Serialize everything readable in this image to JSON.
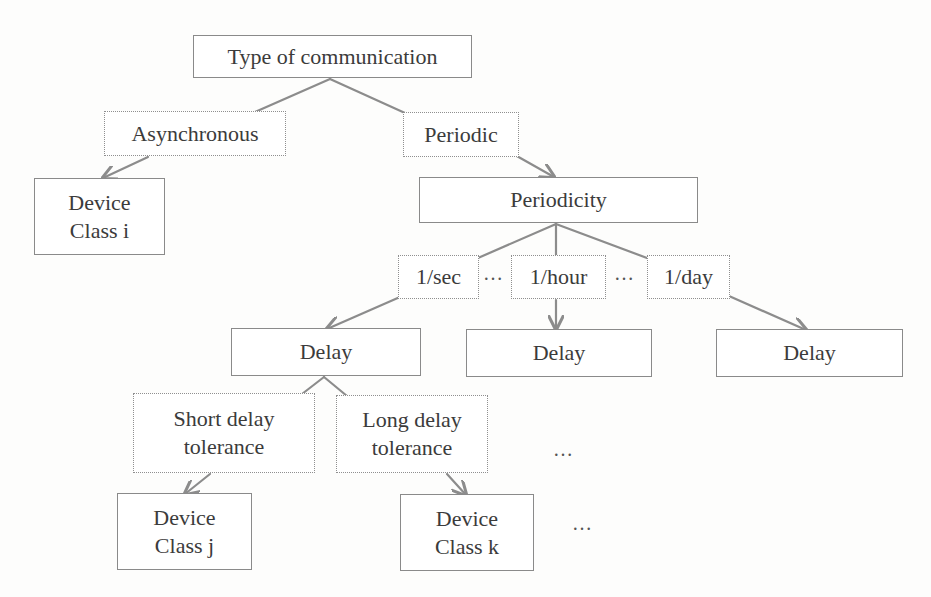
{
  "diagram": {
    "title": "Type of communication",
    "nodes": [
      {
        "id": "root",
        "label": "Type of communication",
        "style": "solid",
        "x": 193,
        "y": 35,
        "w": 279,
        "h": 43
      },
      {
        "id": "async",
        "label": "Asynchronous",
        "style": "dotted",
        "x": 104,
        "y": 111,
        "w": 182,
        "h": 45
      },
      {
        "id": "periodic",
        "label": "Periodic",
        "style": "dotted",
        "x": 403,
        "y": 112,
        "w": 116,
        "h": 45
      },
      {
        "id": "class_i",
        "label": "Device\nClass i",
        "style": "solid",
        "x": 34,
        "y": 178,
        "w": 131,
        "h": 77
      },
      {
        "id": "periodicity",
        "label": "Periodicity",
        "style": "solid",
        "x": 419,
        "y": 177,
        "w": 279,
        "h": 46
      },
      {
        "id": "per_sec",
        "label": "1/sec",
        "style": "dotted",
        "x": 398,
        "y": 255,
        "w": 81,
        "h": 44
      },
      {
        "id": "per_hour",
        "label": "1/hour",
        "style": "dotted",
        "x": 511,
        "y": 255,
        "w": 95,
        "h": 44
      },
      {
        "id": "per_day",
        "label": "1/day",
        "style": "dotted",
        "x": 647,
        "y": 255,
        "w": 83,
        "h": 44
      },
      {
        "id": "delay_sec",
        "label": "Delay",
        "style": "solid",
        "x": 231,
        "y": 328,
        "w": 190,
        "h": 48
      },
      {
        "id": "delay_hour",
        "label": "Delay",
        "style": "solid",
        "x": 466,
        "y": 329,
        "w": 186,
        "h": 48
      },
      {
        "id": "delay_day",
        "label": "Delay",
        "style": "solid",
        "x": 716,
        "y": 329,
        "w": 187,
        "h": 48
      },
      {
        "id": "short_tol",
        "label": "Short delay\ntolerance",
        "style": "dotted",
        "x": 133,
        "y": 393,
        "w": 182,
        "h": 80
      },
      {
        "id": "long_tol",
        "label": "Long delay\ntolerance",
        "style": "dotted",
        "x": 336,
        "y": 395,
        "w": 152,
        "h": 78
      },
      {
        "id": "class_j",
        "label": "Device\nClass j",
        "style": "solid",
        "x": 117,
        "y": 493,
        "w": 135,
        "h": 77
      },
      {
        "id": "class_k",
        "label": "Device\nClass k",
        "style": "solid",
        "x": 400,
        "y": 494,
        "w": 134,
        "h": 77
      }
    ],
    "ellipses": [
      {
        "id": "ell_1",
        "text": "…",
        "x": 483,
        "y": 262
      },
      {
        "id": "ell_2",
        "text": "…",
        "x": 614,
        "y": 262
      },
      {
        "id": "ell_3",
        "text": "…",
        "x": 553,
        "y": 438
      },
      {
        "id": "ell_4",
        "text": "…",
        "x": 572,
        "y": 512
      }
    ],
    "edges": [
      {
        "from": "root",
        "to": "async",
        "x1": 330,
        "y1": 79,
        "x2": 255,
        "y2": 112,
        "arrow": false
      },
      {
        "from": "root",
        "to": "periodic",
        "x1": 330,
        "y1": 79,
        "x2": 405,
        "y2": 113,
        "arrow": false
      },
      {
        "from": "async",
        "to": "class_i",
        "x1": 148,
        "y1": 157,
        "x2": 103,
        "y2": 178,
        "arrow": true
      },
      {
        "from": "periodic",
        "to": "periodicity",
        "x1": 515,
        "y1": 155,
        "x2": 554,
        "y2": 177,
        "arrow": true
      },
      {
        "from": "periodicity",
        "to": "per_sec",
        "x1": 556,
        "y1": 224,
        "x2": 478,
        "y2": 258,
        "arrow": false
      },
      {
        "from": "periodicity",
        "to": "per_hour",
        "x1": 556,
        "y1": 224,
        "x2": 556,
        "y2": 256,
        "arrow": false
      },
      {
        "from": "periodicity",
        "to": "per_day",
        "x1": 556,
        "y1": 224,
        "x2": 647,
        "y2": 258,
        "arrow": false
      },
      {
        "from": "per_sec",
        "to": "delay_sec",
        "x1": 400,
        "y1": 297,
        "x2": 327,
        "y2": 329,
        "arrow": true
      },
      {
        "from": "per_hour",
        "to": "delay_hour",
        "x1": 556,
        "y1": 300,
        "x2": 556,
        "y2": 329,
        "arrow": true
      },
      {
        "from": "per_day",
        "to": "delay_day",
        "x1": 729,
        "y1": 296,
        "x2": 806,
        "y2": 330,
        "arrow": true
      },
      {
        "from": "delay_sec",
        "to": "short_tol",
        "x1": 324,
        "y1": 377,
        "x2": 302,
        "y2": 394,
        "arrow": false
      },
      {
        "from": "delay_sec",
        "to": "long_tol",
        "x1": 324,
        "y1": 377,
        "x2": 347,
        "y2": 396,
        "arrow": false
      },
      {
        "from": "short_tol",
        "to": "class_j",
        "x1": 210,
        "y1": 474,
        "x2": 185,
        "y2": 494,
        "arrow": true
      },
      {
        "from": "long_tol",
        "to": "class_k",
        "x1": 447,
        "y1": 474,
        "x2": 466,
        "y2": 495,
        "arrow": true
      }
    ],
    "colors": {
      "edge": "#8c8c8c",
      "border": "#8a8a8a",
      "text": "#3b3b3b",
      "background": "#fdfdfc"
    }
  }
}
